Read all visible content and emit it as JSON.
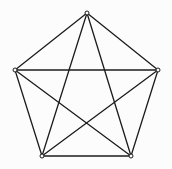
{
  "figure": {
    "name": "complete-graph-k5",
    "width": 172,
    "height": 169,
    "background_color": "#fcfcfc",
    "line_color": "#1c1c1c",
    "line_width": 1.3,
    "vertex_marker": {
      "shape": "open-circle",
      "radius": 2.0,
      "fill_color": "#fcfcfc",
      "stroke_color": "#1c1c1c",
      "stroke_width": 1.0
    }
  },
  "chart_data": {
    "type": "scatter",
    "subtitle": "",
    "xlabel": "",
    "ylabel": "",
    "xlim": [
      0,
      172
    ],
    "ylim": [
      0,
      169
    ],
    "grid": false,
    "legend": null,
    "axes_visible": false,
    "tick_labels": [],
    "annotations": [],
    "graph": {
      "name": "K5",
      "description": "Complete graph on 5 vertices drawn as a regular pentagon with all diagonals forming an inscribed pentagram",
      "vertex_count": 5,
      "edge_count": 10,
      "degree": 4,
      "layout": "regular-pentagon"
    },
    "nodes": [
      {
        "id": "A",
        "label": "",
        "position": "top",
        "x": 87,
        "y": 13
      },
      {
        "id": "B",
        "label": "",
        "position": "right",
        "x": 158,
        "y": 70
      },
      {
        "id": "C",
        "label": "",
        "position": "bottom-right",
        "x": 131,
        "y": 156
      },
      {
        "id": "D",
        "label": "",
        "position": "bottom-left",
        "x": 42,
        "y": 156
      },
      {
        "id": "E",
        "label": "",
        "position": "left",
        "x": 15,
        "y": 70
      }
    ],
    "edges": [
      {
        "from": "A",
        "to": "B",
        "kind": "side"
      },
      {
        "from": "B",
        "to": "C",
        "kind": "side"
      },
      {
        "from": "C",
        "to": "D",
        "kind": "side"
      },
      {
        "from": "D",
        "to": "E",
        "kind": "side"
      },
      {
        "from": "E",
        "to": "A",
        "kind": "side"
      },
      {
        "from": "A",
        "to": "C",
        "kind": "diagonal"
      },
      {
        "from": "A",
        "to": "D",
        "kind": "diagonal"
      },
      {
        "from": "B",
        "to": "D",
        "kind": "diagonal"
      },
      {
        "from": "B",
        "to": "E",
        "kind": "diagonal"
      },
      {
        "from": "C",
        "to": "E",
        "kind": "diagonal"
      }
    ]
  }
}
